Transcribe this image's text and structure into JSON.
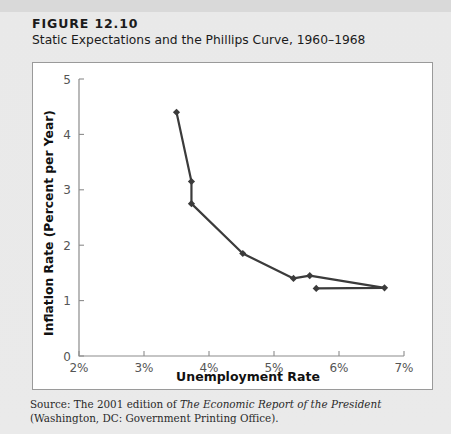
{
  "figure": {
    "label": "FIGURE 12.10",
    "title": "Static Expectations and the Phillips Curve, 1960–1968"
  },
  "source": {
    "prefix": "Source: The 2001 edition of ",
    "italic": "The Economic Report of the President",
    "suffix": " (Washington, DC: Government Printing Office)."
  },
  "chart_data": {
    "type": "line",
    "title": "Static Expectations and the Phillips Curve, 1960–1968",
    "xlabel": "Unemployment Rate",
    "ylabel": "Inflation Rate (Percent per Year)",
    "xlim": [
      2,
      7
    ],
    "ylim": [
      0,
      5
    ],
    "xticks": [
      2,
      3,
      4,
      5,
      6,
      7
    ],
    "xticklabels": [
      "2%",
      "3%",
      "4%",
      "5%",
      "6%",
      "7%"
    ],
    "yticks": [
      0,
      1,
      2,
      3,
      4,
      5
    ],
    "yticklabels": [
      "0",
      "1",
      "2",
      "3",
      "4",
      "5"
    ],
    "grid": false,
    "legend": null,
    "marker": "diamond",
    "line_color": "#3b3b3b",
    "series": [
      {
        "name": "Phillips Curve 1960–1968",
        "x": [
          3.5,
          3.73,
          3.73,
          4.52,
          5.3,
          5.55,
          6.7,
          5.65
        ],
        "y": [
          4.4,
          3.15,
          2.75,
          1.85,
          1.4,
          1.45,
          1.23,
          1.22
        ]
      }
    ],
    "points": [
      {
        "x": 3.5,
        "y": 4.4
      },
      {
        "x": 3.73,
        "y": 3.15
      },
      {
        "x": 3.73,
        "y": 2.75
      },
      {
        "x": 4.52,
        "y": 1.85
      },
      {
        "x": 5.3,
        "y": 1.4
      },
      {
        "x": 5.55,
        "y": 1.45
      },
      {
        "x": 6.7,
        "y": 1.23
      },
      {
        "x": 5.65,
        "y": 1.22
      }
    ]
  }
}
